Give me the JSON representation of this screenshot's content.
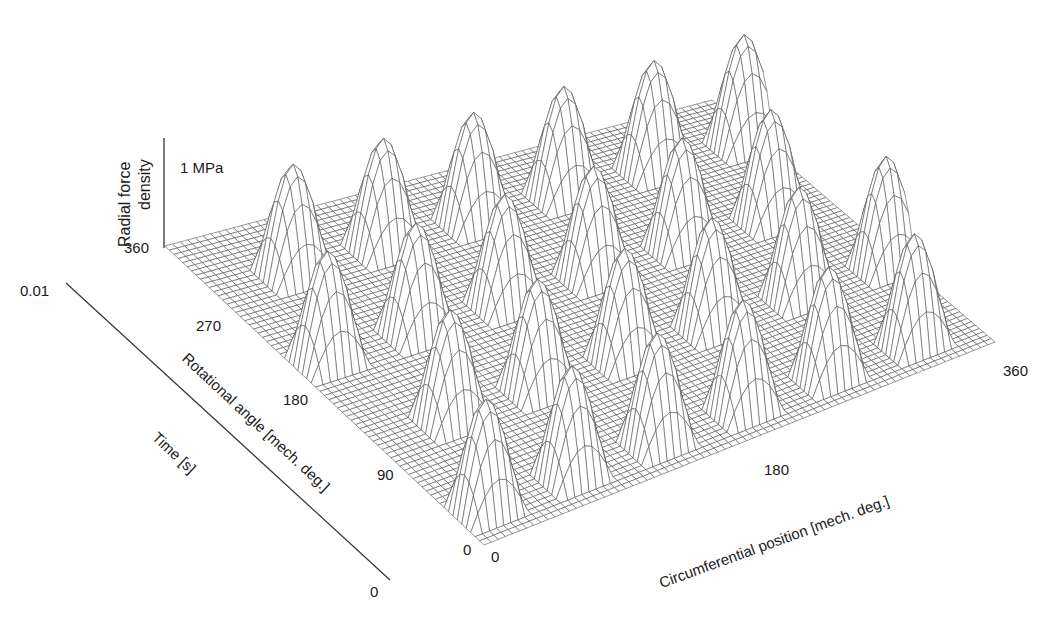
{
  "chart_data": {
    "type": "surface3d",
    "title": "",
    "zlabel": "Radial force density",
    "z_scale_bar": "1 MPa",
    "xlabel": "Circumferential position [mech. deg.]",
    "ylabel": "Rotational angle [mech. deg.]",
    "y2label": "Time [s]",
    "x_ticks": [
      "0",
      "180",
      "360"
    ],
    "y_ticks": [
      "0",
      "90",
      "180",
      "270",
      "360"
    ],
    "y2_ticks": [
      "0",
      "0.01"
    ],
    "x_range": [
      0,
      360
    ],
    "y_range": [
      0,
      360
    ],
    "y2_range": [
      0,
      0.01
    ],
    "z_peak_approx_MPa": 1.0,
    "mesh": true,
    "peaks_per_circumference": 6,
    "peak_rows": 4,
    "peak_width_deg": 40,
    "peaks": [
      {
        "rot": 30,
        "circ": 20
      },
      {
        "rot": 30,
        "circ": 80
      },
      {
        "rot": 30,
        "circ": 140
      },
      {
        "rot": 30,
        "circ": 200
      },
      {
        "rot": 30,
        "circ": 260
      },
      {
        "rot": 30,
        "circ": 320
      },
      {
        "rot": 120,
        "circ": 50
      },
      {
        "rot": 120,
        "circ": 110
      },
      {
        "rot": 120,
        "circ": 170
      },
      {
        "rot": 120,
        "circ": 230
      },
      {
        "rot": 120,
        "circ": 290
      },
      {
        "rot": 120,
        "circ": 350
      },
      {
        "rot": 210,
        "circ": 20
      },
      {
        "rot": 210,
        "circ": 80
      },
      {
        "rot": 210,
        "circ": 140
      },
      {
        "rot": 210,
        "circ": 200
      },
      {
        "rot": 210,
        "circ": 260
      },
      {
        "rot": 210,
        "circ": 320
      },
      {
        "rot": 300,
        "circ": 50
      },
      {
        "rot": 300,
        "circ": 110
      },
      {
        "rot": 300,
        "circ": 170
      },
      {
        "rot": 300,
        "circ": 230
      },
      {
        "rot": 300,
        "circ": 290
      },
      {
        "rot": 300,
        "circ": 350
      }
    ]
  },
  "labels": {
    "zlabel_line1": "Radial force",
    "zlabel_line2": "density",
    "scale": "1 MPa",
    "xlabel": "Circumferential position [mech. deg.]",
    "ylabel": "Rotational angle [mech. deg.]",
    "tlabel": "Time [s]",
    "x0": "0",
    "x180": "180",
    "x360": "360",
    "y0": "0",
    "y90": "90",
    "y180": "180",
    "y270": "270",
    "y360": "360",
    "t0": "0",
    "t001": "0.01"
  }
}
